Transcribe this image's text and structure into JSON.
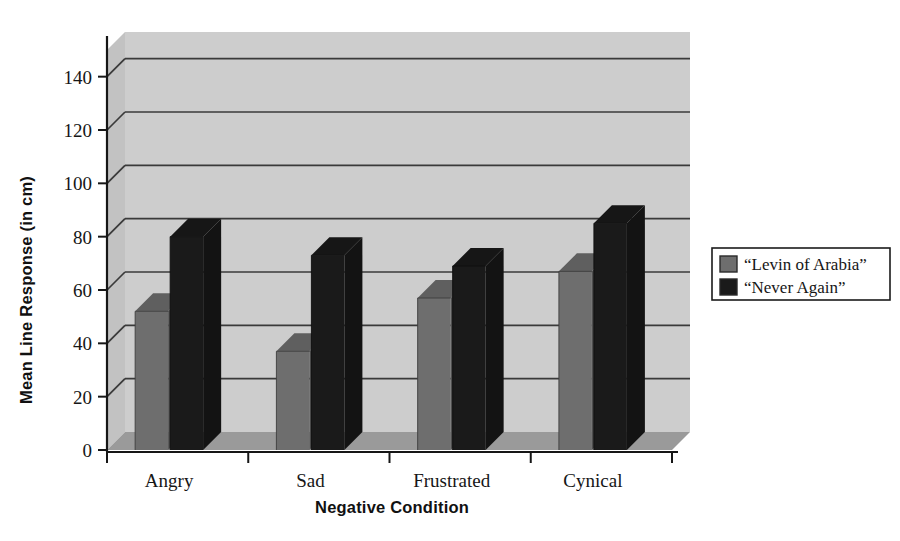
{
  "chart_data": {
    "type": "bar",
    "title": "",
    "subtitle": "",
    "xlabel": "Negative Condition",
    "ylabel": "Mean Line Response (in cm)",
    "categories": [
      "Angry",
      "Sad",
      "Frustrated",
      "Cynical"
    ],
    "series": [
      {
        "name": "“Levin of Arabia”",
        "values": [
          52,
          37,
          57,
          67
        ],
        "color": "#6e6e6e"
      },
      {
        "name": "“Never Again”",
        "values": [
          80,
          73,
          69,
          85
        ],
        "color": "#1a1a1a"
      }
    ],
    "ylim": [
      0,
      150
    ],
    "yticks": [
      0,
      20,
      40,
      60,
      80,
      100,
      120,
      140
    ],
    "ytick_labels": [
      "0",
      "20",
      "40",
      "60",
      "80",
      "100",
      "120",
      "140"
    ],
    "grid": true,
    "grid_axis": "y",
    "legend_position": "right",
    "style": "3d",
    "plot_background": "#cdcdcd",
    "page_background": "#ffffff",
    "gridline_color": "#3a3a3a"
  },
  "legend": {
    "entries": [
      {
        "label": "“Levin of Arabia”",
        "swatch": "#6e6e6e"
      },
      {
        "label": "“Never Again”",
        "swatch": "#1a1a1a"
      }
    ]
  }
}
